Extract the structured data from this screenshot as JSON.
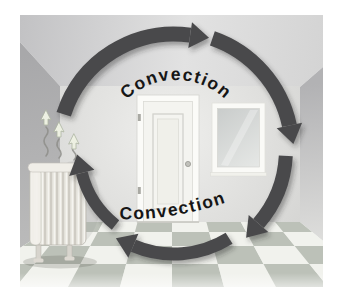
{
  "diagram": {
    "labels": {
      "top_label": "Convection",
      "bottom_label": "Convection"
    },
    "colors": {
      "arrow": "#4a4a4c",
      "label_text": "#161616",
      "ceiling_left": "#c2c2c4",
      "ceiling_right": "#d6d6d6",
      "left_wall": "#aaaaac",
      "right_wall_top": "#b2b2b4",
      "right_wall_bottom": "#e0e0de",
      "back_wall_center": "#efefed",
      "back_wall_edge": "#d3d3d1",
      "tile_light": "#f1f2ed",
      "tile_dark": "#bcc1b8",
      "door_white": "#fbfbf8",
      "window_glass": "#cdd0cf",
      "radiator_body": "#e9e7e0",
      "heat_arrow": "#edf0e2"
    },
    "cycle": {
      "cx": 154,
      "cy": 135,
      "head_length": 19,
      "head_width": 26,
      "direction": "clockwise",
      "segments": [
        {
          "from": 162,
          "to": 82,
          "r": 116,
          "w": 15
        },
        {
          "from": 71,
          "to": 12,
          "r": 118,
          "w": 15
        },
        {
          "from": 357,
          "to": 319,
          "r": 112,
          "w": 14
        },
        {
          "from": 302,
          "to": 247,
          "r": 104,
          "w": 13
        },
        {
          "from": 232,
          "to": 194,
          "r": 95,
          "w": 12
        }
      ]
    },
    "scene_elements": [
      "radiator",
      "heat-rising-arrows",
      "door",
      "window",
      "checkered-floor",
      "room-walls"
    ]
  },
  "floor": {
    "vp_x": 152,
    "vp_y": 80,
    "row_ys": [
      207,
      217,
      231,
      249,
      272
    ],
    "front_step": 52,
    "k_min": -4,
    "k_max": 4
  }
}
